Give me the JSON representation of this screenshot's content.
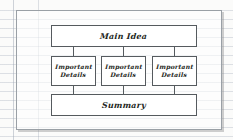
{
  "document": {
    "type": "graphic-organizer",
    "style": "hand-drawn on lined notebook paper"
  },
  "organizer": {
    "main_idea": {
      "label": "Main Idea"
    },
    "details": [
      {
        "label": "Important\nDetails"
      },
      {
        "label": "Important\nDetails"
      },
      {
        "label": "Important\nDetails"
      }
    ],
    "summary": {
      "label": "Summary"
    },
    "connectors": [
      {
        "from": "main_idea",
        "to": "detail-1"
      },
      {
        "from": "main_idea",
        "to": "detail-2"
      },
      {
        "from": "main_idea",
        "to": "detail-3"
      },
      {
        "from": "detail-1",
        "to": "summary"
      },
      {
        "from": "detail-2",
        "to": "summary"
      },
      {
        "from": "detail-3",
        "to": "summary"
      }
    ]
  },
  "colors": {
    "paper": "#fbfbfa",
    "rule_line": "#96a0af",
    "box_stroke": "#555a5e",
    "frame_stroke": "#9aa0a6",
    "text": "#1d1f21"
  }
}
